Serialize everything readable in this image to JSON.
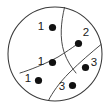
{
  "figure": {
    "background_color": "#ffffff",
    "outline_color": "#3a3a3a",
    "divider_color": "#4a4a4a",
    "dot_color": "#111111",
    "label_color": "#1a1a1a"
  },
  "chart_data": {
    "type": "scatter",
    "title": "",
    "xlabel": "",
    "ylabel": "",
    "grid": false,
    "legend": false,
    "shape": {
      "kind": "circle",
      "center_x": 55,
      "center_y": 54,
      "radius": 47
    },
    "dividers": [
      {
        "id": "divider-1",
        "description": "curve from top of circle down to lower-middle crossing",
        "path": "M 64.5 7.5 C 61 22, 59.5 38, 64 52 C 67 61, 72 68, 76 73"
      },
      {
        "id": "divider-2",
        "description": "curve from right edge of circle sweeping down-left to bottom of circle",
        "path": "M 101 44.5 C 92 52, 80 62, 69 73 C 60 82, 52 93, 48.5 100.5"
      },
      {
        "id": "divider-3",
        "description": "curve from left-middle region down through crossing toward bottom",
        "path": "M 20 73 C 30 70, 45 64, 58 57 C 66 52, 72 48, 76 45"
      }
    ],
    "points": [
      {
        "id": "p1",
        "label": "1",
        "dot_x": 52.5,
        "dot_y": 27.5,
        "label_x": 41,
        "label_y": 26.5,
        "region": "left"
      },
      {
        "id": "p2",
        "label": "2",
        "dot_x": 78.5,
        "dot_y": 43.5,
        "label_x": 86,
        "label_y": 33,
        "region": "upper-right"
      },
      {
        "id": "p3",
        "label": "1",
        "dot_x": 52.5,
        "dot_y": 62.5,
        "label_x": 41,
        "label_y": 61.5,
        "region": "left"
      },
      {
        "id": "p4",
        "label": "3",
        "dot_x": 85.5,
        "dot_y": 67.5,
        "label_x": 94,
        "label_y": 63,
        "region": "right"
      },
      {
        "id": "p5",
        "label": "1",
        "dot_x": 38.5,
        "dot_y": 80.5,
        "label_x": 28,
        "label_y": 79,
        "region": "left"
      },
      {
        "id": "p6",
        "label": "3",
        "dot_x": 72.5,
        "dot_y": 85.5,
        "label_x": 62,
        "label_y": 87,
        "region": "bottom"
      }
    ],
    "label_counts": {
      "1": 3,
      "2": 1,
      "3": 2
    },
    "dot_radius": 3.6,
    "total_points": 6,
    "region_count": 4
  }
}
